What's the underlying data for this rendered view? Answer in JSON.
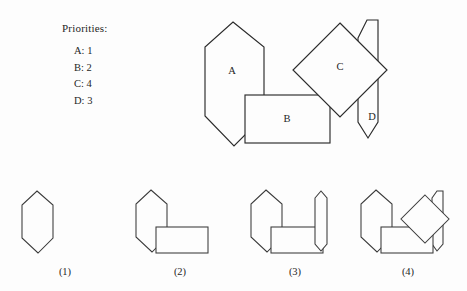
{
  "legend": {
    "title": "Priorities:",
    "entries": [
      {
        "shape": "A",
        "priority": "1",
        "text": "A: 1"
      },
      {
        "shape": "B",
        "priority": "2",
        "text": "B: 2"
      },
      {
        "shape": "C",
        "priority": "4",
        "text": "C: 4"
      },
      {
        "shape": "D",
        "priority": "3",
        "text": "D: 3"
      }
    ]
  },
  "main_figure": {
    "shapes": [
      {
        "id": "A",
        "label": "A",
        "kind": "elongated-hexagon",
        "label_x": 42,
        "label_y": 62
      },
      {
        "id": "B",
        "label": "B",
        "kind": "rectangle",
        "label_x": 97,
        "label_y": 110
      },
      {
        "id": "C",
        "label": "C",
        "kind": "diamond-square",
        "label_x": 150,
        "label_y": 58
      },
      {
        "id": "D",
        "label": "D",
        "kind": "narrow-hexagon",
        "label_x": 182,
        "label_y": 108
      }
    ]
  },
  "options": [
    {
      "id": "1",
      "label": "(1)",
      "contains": [
        "A"
      ]
    },
    {
      "id": "2",
      "label": "(2)",
      "contains": [
        "A",
        "B"
      ]
    },
    {
      "id": "3",
      "label": "(3)",
      "contains": [
        "A",
        "B",
        "D"
      ]
    },
    {
      "id": "4",
      "label": "(4)",
      "contains": [
        "A",
        "B",
        "C",
        "D"
      ]
    }
  ],
  "colors": {
    "background": "#fdfdfd",
    "stroke": "#2b2b2b",
    "fill": "#fdfdfd",
    "text": "#262626"
  }
}
